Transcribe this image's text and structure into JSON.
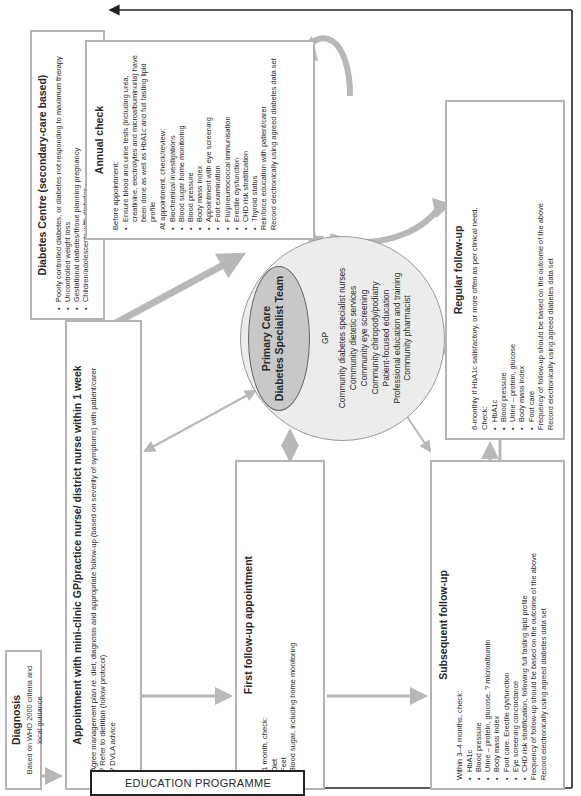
{
  "diagnosis": {
    "title": "Diagnosis",
    "subtitle": "Based on WHO 2000 criteria and local guidance"
  },
  "appointment": {
    "title": "Appointment with mini-clinic GP/practice nurse/ district nurse within 1 week",
    "items": [
      {
        "bullet": true,
        "text": "Agree management plan re. diet, diagnosis and appropriate follow-up (based on severity of symptoms) with patient/carer"
      },
      {
        "bullet": true,
        "text": "? Refer to dietitian (follow protocol)"
      },
      {
        "bullet": true,
        "text": "? DVLA advice"
      },
      {
        "bullet": true,
        "text": "Blood pressure (follow protocol)"
      },
      {
        "bullet": true,
        "text": "Smoking, alcohol and activity"
      },
      {
        "bullet": false,
        "text": "Record electronically using agreed diabetes data set"
      },
      {
        "bullet": false,
        "text": "Add to practice register"
      }
    ]
  },
  "diabetes_centre": {
    "title": "Diabetes Centre (secondary-care based)",
    "items": [
      "Poorly controlled diabetes, or diabetes not responding to maximum therapy",
      "Uncontrolled weight loss",
      "Gestational diabetes/those planning pregnancy",
      "Children/adolescents with diabetes",
      "Patients with worrying complications of diabetes, i.e. renal, ocular, vascular or neuropathic",
      "All newly diagnosed type 1 diabetes"
    ]
  },
  "annual_check": {
    "title": "Annual check",
    "before_label": "Before appointment:",
    "before_item": "Ensure blood and urine tests (including urea, creatinine, electrolytes and microalbuminuria) have been done as well as HbA1c and full fasting lipid profile",
    "at_label": "At appointment, check/review:",
    "items": [
      "Biochemical investigations",
      "Blood sugar home monitoring",
      "Blood pressure",
      "Body mass index",
      "Appointment with eye screening",
      "Foot examination",
      "Flu/pneumococcal immunisation",
      "Erectile dysfunction",
      "CHD risk stratification",
      "Thyroid status"
    ],
    "footer": [
      "Reinforce education with patient/carer",
      "Record electronically using agreed diabetes data set"
    ]
  },
  "team": {
    "ellipse_line1": "Primary Care",
    "ellipse_line2": "Diabetes Specialist Team",
    "members": [
      "GP",
      "Community diabetes specialist nurses",
      "Community dietetic services",
      "Community eye screening",
      "Community chiropody/podiatry",
      "Patient-focused education",
      "Professional education and training",
      "Community pharmacist"
    ]
  },
  "regular_followup": {
    "title": "Regular follow-up",
    "intro": "6-monthly if HbA1c satisfactory, or more often as per clinical need.",
    "check_label": "Check:",
    "items": [
      "HbA1c",
      "Blood pressure",
      "Urine – protein, glucose",
      "Body mass index",
      "Foot care"
    ],
    "footer": [
      "Frequency of follow-up should be based on the outcome of the above",
      "Record electronically using agreed diabetes data set"
    ]
  },
  "first_followup": {
    "title": "First follow-up appointment",
    "intro": "At 1 month, check:",
    "items": [
      "Diet",
      "Feet",
      "Blood sugar, including home monitoring",
      "Weight and body mass index",
      "Blood pressure (follow protocol)",
      "Smoking, alcohol and activity"
    ],
    "footer": [
      "Reinforce education",
      "Book eye screening appointment",
      "Record electronically using agreed diabetes data set"
    ]
  },
  "subsequent_followup": {
    "title": "Subsequent follow-up",
    "intro": "Within 3–4 months, check:",
    "items": [
      "HbA1c",
      "Blood pressure",
      "Urine – protein, glucose, ? microalbumin",
      "Body mass index",
      "Foot care. Erectile dysfunction",
      "Eye screening concordance",
      "CHD risk stratification, following full fasting lipid profile"
    ],
    "footer": [
      "Frequency of follow-up should be based on the outcome of the above",
      "Record electronically using agreed diabetes data set"
    ]
  },
  "education": {
    "label": "EDUCATION PROGRAMME"
  },
  "colors": {
    "box_border": "#b4b4b4",
    "arrow_grey": "#b8b8b8",
    "circle_fill": "#ececec",
    "ellipse_fill": "#c8c8c8",
    "black_line": "#222222"
  }
}
